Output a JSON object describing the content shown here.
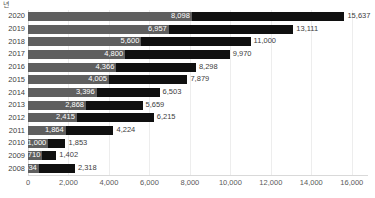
{
  "chart_data": {
    "type": "bar",
    "orientation": "horizontal",
    "stacked": true,
    "title": "",
    "subtitle": "",
    "xlabel": "",
    "ylabel": "년",
    "categories": [
      "2020",
      "2019",
      "2018",
      "2017",
      "2016",
      "2015",
      "2014",
      "2013",
      "2012",
      "2011",
      "2010",
      "2009",
      "2008"
    ],
    "series": [
      {
        "name": "segment-1",
        "color": "#5f5f5f",
        "values": [
          8098,
          6957,
          5600,
          4800,
          4366,
          4005,
          3396,
          2868,
          2415,
          1864,
          1000,
          710,
          534
        ],
        "labels": [
          "8,098",
          "6,957",
          "5,600",
          "4,800",
          "4,366",
          "4,005",
          "3,396",
          "2,868",
          "2,415",
          "1,864",
          "1,000",
          "710",
          "534"
        ]
      },
      {
        "name": "segment-2",
        "color": "#101010",
        "values": [
          7539,
          6154,
          5400,
          5170,
          3932,
          3874,
          3107,
          2791,
          3800,
          2360,
          853,
          692,
          1784
        ],
        "labels": [
          "7,539",
          "6,154",
          "5,400",
          "5,170",
          "3,932",
          "3,874",
          "3,107",
          "2,791",
          "3,800",
          "2,360",
          "853",
          "692",
          "1,784"
        ]
      }
    ],
    "totals": [
      15637,
      13111,
      11000,
      9970,
      8298,
      7879,
      6503,
      5659,
      6215,
      4224,
      1853,
      1402,
      2318
    ],
    "total_labels": [
      "15,637",
      "13,111",
      "11,000",
      "9,970",
      "8,298",
      "7,879",
      "6,503",
      "5,659",
      "6,215",
      "4,224",
      "1,853",
      "1,402",
      "2,318"
    ],
    "xticks": [
      0,
      2000,
      4000,
      6000,
      8000,
      10000,
      12000,
      14000,
      16000
    ],
    "xtick_labels": [
      "0",
      "2,000",
      "4,000",
      "6,000",
      "8,000",
      "10,000",
      "12,000",
      "14,000",
      "16,000"
    ],
    "xlim": [
      0,
      16800
    ],
    "grid": true,
    "grid_axis": "x",
    "legend": "none",
    "gridline_color": "#ededed",
    "axis_color": "#d9d9d9",
    "label_color": "#404040"
  }
}
